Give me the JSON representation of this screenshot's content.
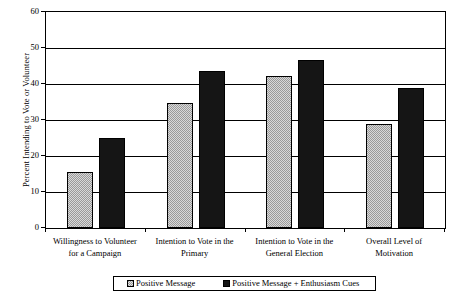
{
  "chart_data": {
    "type": "bar",
    "title": "",
    "xlabel": "",
    "ylabel": "Percent Intending to Vote or Volunteer",
    "ylim": [
      0,
      60
    ],
    "yticks": [
      0,
      10,
      20,
      30,
      40,
      50,
      60
    ],
    "ytick_labels": [
      "0",
      "10",
      "20",
      "30",
      "40",
      "50",
      "60"
    ],
    "grid": true,
    "legend_position": "bottom",
    "categories": [
      "Willingness to Volunteer for a Campaign",
      "Intention to Vote in the Primary",
      "Intention to Vote in the General Election",
      "Overall Level of Motivation"
    ],
    "category_lines": [
      [
        "Willingness to Volunteer",
        "for a Campaign"
      ],
      [
        "Intention to Vote in the",
        "Primary"
      ],
      [
        "Intention to Vote in the",
        "General Election"
      ],
      [
        "Overall Level of",
        "Motivation"
      ]
    ],
    "series": [
      {
        "name": "Positive Message",
        "color": "#9a9a9a",
        "values": [
          15.5,
          34.7,
          42.2,
          28.8
        ]
      },
      {
        "name": "Positive Message + Enthusiasm Cues",
        "color": "#151515",
        "values": [
          25.0,
          43.7,
          46.7,
          39.0
        ]
      }
    ]
  },
  "legend": {
    "entries": [
      {
        "label": "Positive Message"
      },
      {
        "label": "Positive Message + Enthusiasm Cues"
      }
    ]
  }
}
